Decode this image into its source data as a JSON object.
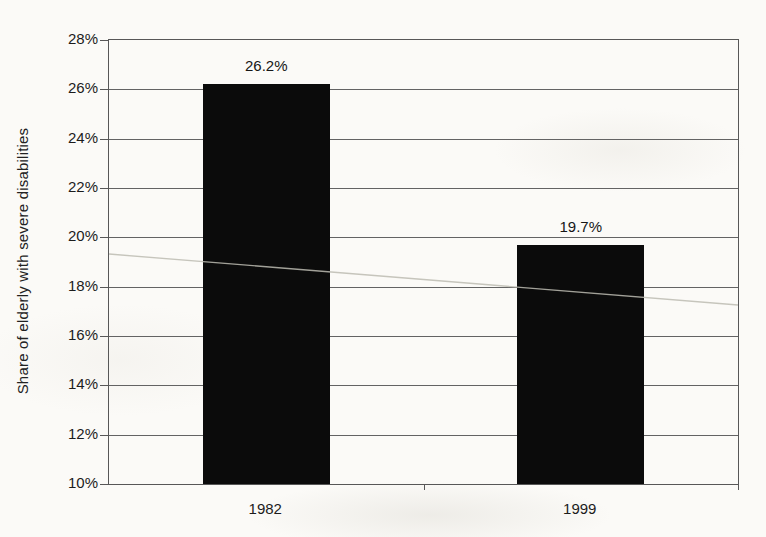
{
  "chart_data": {
    "type": "bar",
    "title": "",
    "xlabel": "",
    "ylabel": "Share of elderly with severe disabilities",
    "categories": [
      "1982",
      "1999"
    ],
    "values": [
      26.2,
      19.7
    ],
    "value_labels": [
      "26.2%",
      "19.7%"
    ],
    "ylim": [
      10,
      28
    ],
    "yticks": [
      {
        "value": 10,
        "label": "10%"
      },
      {
        "value": 12,
        "label": "12%"
      },
      {
        "value": 14,
        "label": "14%"
      },
      {
        "value": 16,
        "label": "16%"
      },
      {
        "value": 18,
        "label": "18%"
      },
      {
        "value": 20,
        "label": "20%"
      },
      {
        "value": 22,
        "label": "22%"
      },
      {
        "value": 24,
        "label": "24%"
      },
      {
        "value": 26,
        "label": "26%"
      },
      {
        "value": 28,
        "label": "28%"
      }
    ],
    "grid": true,
    "legend": false,
    "colors": {
      "bar": "#0b0b0b",
      "axis_line": "#575757",
      "gridline": "#636363",
      "text": "#1c1c1c",
      "paper_background": "#fbfaf7"
    }
  }
}
